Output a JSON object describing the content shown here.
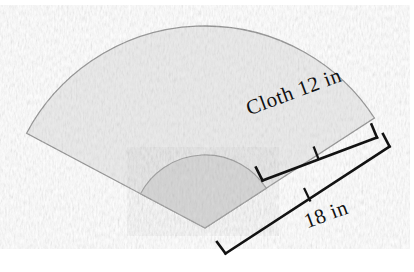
{
  "figure": {
    "shape": "annular circular sector (hand fan)",
    "labels": {
      "cloth": "Cloth 12 in",
      "total_radius": "18 in"
    },
    "measurements": [
      {
        "name": "cloth-width",
        "value": 12,
        "unit": "in",
        "text": "Cloth 12 in"
      },
      {
        "name": "total-radius",
        "value": 18,
        "unit": "in",
        "text": "18 in"
      }
    ],
    "colors": {
      "outer_fill": "#e9e9e9",
      "inner_fill": "#d3d3d3",
      "outline": "#8c8c8c",
      "dimension_line": "#121212",
      "background": "#ffffff"
    },
    "geometry": {
      "apex_x": 205,
      "apex_y": 228,
      "outer_radius": 202,
      "inner_radius": 73,
      "start_angle_deg": 208,
      "end_angle_deg": 327
    }
  }
}
